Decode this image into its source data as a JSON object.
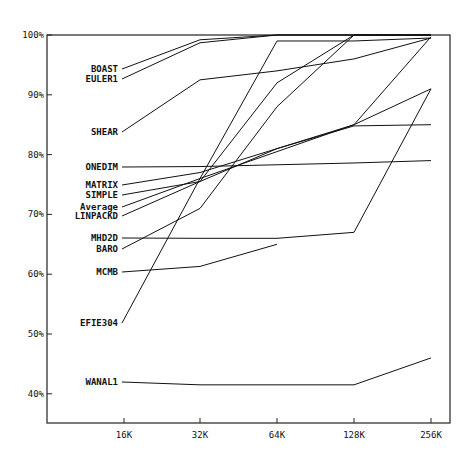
{
  "chart_data": {
    "type": "line",
    "title": "",
    "xlabel": "",
    "ylabel": "",
    "categories": [
      "16K",
      "32K",
      "64K",
      "128K",
      "256K"
    ],
    "y_ticks": [
      "100%",
      "90%",
      "80%",
      "70%",
      "60%",
      "50%",
      "40%"
    ],
    "ylim": [
      35,
      100
    ],
    "grid": false,
    "legend_position": "inline labels at left",
    "series": [
      {
        "name": "BOAST",
        "values": [
          93,
          99.2,
          100,
          100,
          100
        ]
      },
      {
        "name": "EULER1",
        "values": [
          92.5,
          98.7,
          100,
          100,
          100
        ]
      },
      {
        "name": "SHEAR",
        "values": [
          83.5,
          92.5,
          94,
          96,
          99.5
        ]
      },
      {
        "name": "ONEDIM",
        "values": [
          77.5,
          78,
          78.3,
          78.6,
          79
        ]
      },
      {
        "name": "MATRIX",
        "values": [
          74.5,
          77,
          81,
          84.8,
          85
        ]
      },
      {
        "name": "SIMPLE",
        "values": [
          72.5,
          75.5,
          81,
          85,
          91
        ]
      },
      {
        "name": "Average",
        "values": [
          71,
          76,
          80.5,
          85,
          99.7
        ]
      },
      {
        "name": "LINPACKD",
        "values": [
          69.5,
          75.5,
          92,
          100,
          100
        ]
      },
      {
        "name": "MHD2D",
        "values": [
          65.8,
          66,
          66,
          67,
          91
        ]
      },
      {
        "name": "BARO",
        "values": [
          64,
          71,
          88,
          100,
          100
        ]
      },
      {
        "name": "MCMB",
        "values": [
          60,
          61.3,
          65,
          null,
          null
        ]
      },
      {
        "name": "EFIE304",
        "values": [
          51.5,
          76,
          99,
          99,
          99.5
        ]
      },
      {
        "name": "WANAL1",
        "values": [
          41.5,
          41.5,
          41.5,
          41.5,
          46
        ]
      }
    ]
  },
  "labels": {
    "BOAST": {
      "text": "BOAST",
      "y": 72
    },
    "EULER1": {
      "text": "EULER1",
      "y": 82
    },
    "SHEAR": {
      "text": "SHEAR",
      "y": 135
    },
    "ONEDIM": {
      "text": "ONEDIM",
      "y": 170
    },
    "MATRIX": {
      "text": "MATRIX",
      "y": 188
    },
    "SIMPLE": {
      "text": "SIMPLE",
      "y": 198
    },
    "Average": {
      "text": "Average",
      "y": 210
    },
    "LINPACKD": {
      "text": "LINPACKD",
      "y": 219
    },
    "MHD2D": {
      "text": "MHD2D",
      "y": 241
    },
    "BARO": {
      "text": "BARO",
      "y": 252
    },
    "MCMB": {
      "text": "MCMB",
      "y": 275
    },
    "EFIE304": {
      "text": "EFIE304",
      "y": 326
    },
    "WANAL1": {
      "text": "WANAL1",
      "y": 385
    }
  }
}
